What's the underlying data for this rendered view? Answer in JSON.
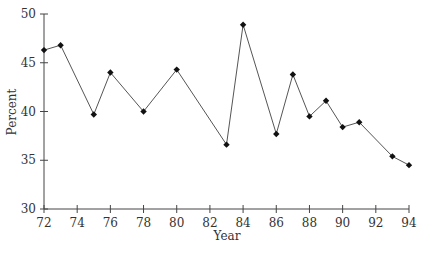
{
  "chart_data": {
    "type": "line",
    "title": "",
    "xlabel": "Year",
    "ylabel": "Percent",
    "x": [
      72,
      73,
      75,
      76,
      78,
      80,
      83,
      84,
      86,
      87,
      88,
      89,
      90,
      91,
      93,
      94
    ],
    "values": [
      46.3,
      46.8,
      39.7,
      44.0,
      40.0,
      44.3,
      36.6,
      48.9,
      37.7,
      43.8,
      39.5,
      41.1,
      38.4,
      38.9,
      35.4,
      34.5
    ],
    "xticks": [
      "72",
      "74",
      "76",
      "78",
      "80",
      "82",
      "84",
      "86",
      "88",
      "90",
      "92",
      "94"
    ],
    "yticks": [
      "30",
      "35",
      "40",
      "45",
      "50"
    ],
    "xlim": [
      72,
      94
    ],
    "ylim": [
      30,
      50
    ],
    "grid": false,
    "marker": "diamond",
    "line_color": "#555555",
    "marker_color": "#111111"
  }
}
